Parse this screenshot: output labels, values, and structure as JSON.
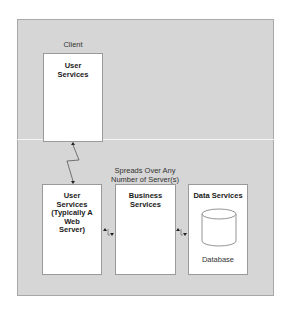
{
  "diagram": {
    "tiers": {
      "client": {
        "label": "Client",
        "box_title": "User\nServices"
      },
      "server": {
        "label": "Spreads Over Any\nNumber of Server(s)",
        "boxes": [
          {
            "title": "User\nServices\n(Typically A Web\nServer)"
          },
          {
            "title": "Business\nServices"
          },
          {
            "title": "Data Services",
            "inner_label": "Database",
            "icon": "database-cylinder-icon"
          }
        ]
      }
    },
    "connectors": [
      {
        "from": "client-user-services",
        "to": "server-user-services",
        "style": "lightning-zigzag-bidirectional"
      },
      {
        "from": "server-user-services",
        "to": "business-services",
        "style": "bidirectional"
      },
      {
        "from": "business-services",
        "to": "data-services",
        "style": "bidirectional"
      }
    ],
    "colors": {
      "background": "#d6d6d6",
      "box_fill": "#ffffff",
      "border": "#9a9a9a",
      "text": "#1a1a1a",
      "divider": "#f4f4f4"
    }
  }
}
